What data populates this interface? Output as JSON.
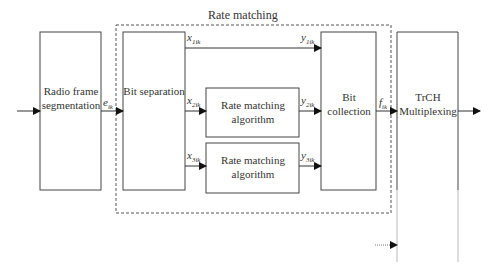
{
  "diagram": {
    "group_title": "Rate matching",
    "blocks": {
      "radio_frame": "Radio frame\nsegmentation",
      "bit_separation": "Bit separation",
      "rate_matching_1": "Rate matching\nalgorithm",
      "rate_matching_2": "Rate matching\nalgorithm",
      "bit_collection": "Bit\ncollection",
      "trch": "TrCH\nMultiplexing"
    },
    "signals": {
      "e": {
        "base": "e",
        "sub": "ik"
      },
      "x1": {
        "base": "x",
        "sub": "1ik"
      },
      "x2": {
        "base": "x",
        "sub": "2ik"
      },
      "x3": {
        "base": "x",
        "sub": "3ik"
      },
      "y1": {
        "base": "y",
        "sub": "1ik"
      },
      "y2": {
        "base": "y",
        "sub": "2ik"
      },
      "y3": {
        "base": "y",
        "sub": "3ik"
      },
      "f": {
        "base": "f",
        "sub": "ik"
      }
    },
    "colors": {
      "line": "#333333",
      "faint": "#bbbbbb",
      "dashed": "#555555"
    }
  }
}
